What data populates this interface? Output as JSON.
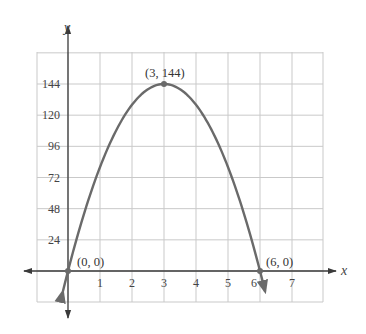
{
  "chart_data": {
    "type": "line",
    "title": "",
    "xlabel": "x",
    "ylabel": "y",
    "function_description": "Parabola opening downward through (0,0), vertex (3,144), (6,0); y = -16x^2 + 96x",
    "x_ticks": [
      "1",
      "2",
      "3",
      "4",
      "5",
      "6",
      "7"
    ],
    "y_ticks": [
      "24",
      "48",
      "72",
      "96",
      "120",
      "144"
    ],
    "xlim": [
      -1,
      8
    ],
    "ylim": [
      -24,
      168
    ],
    "grid": true,
    "legend": null,
    "series": [
      {
        "name": "parabola",
        "x": [
          0,
          0.5,
          1,
          1.5,
          2,
          2.5,
          3,
          3.5,
          4,
          4.5,
          5,
          5.5,
          6
        ],
        "y": [
          0,
          44,
          80,
          108,
          128,
          140,
          144,
          140,
          128,
          108,
          80,
          44,
          0
        ]
      }
    ],
    "annotations": [
      {
        "label": "(0, 0)",
        "x": 0,
        "y": 0
      },
      {
        "label": "(3, 144)",
        "x": 3,
        "y": 144
      },
      {
        "label": "(6, 0)",
        "x": 6,
        "y": 0
      }
    ]
  },
  "labels": {
    "x_axis": "x",
    "y_axis": "y",
    "point_origin": "(0, 0)",
    "point_vertex": "(3, 144)",
    "point_root": "(6, 0)"
  },
  "colors": {
    "curve": "#6a6a6a",
    "grid": "#c9c9c9",
    "axis": "#3a3a3a",
    "text": "#444444"
  }
}
